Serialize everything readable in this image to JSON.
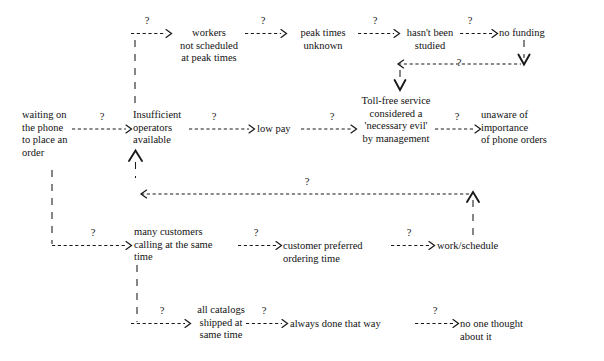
{
  "diagram": {
    "link_label": "?",
    "nodes": [
      {
        "id": "waiting",
        "text": "waiting on\nthe phone\nto place an\norder"
      },
      {
        "id": "workers",
        "text": "workers\nnot scheduled\nat peak times"
      },
      {
        "id": "peaktimes",
        "text": "peak times\nunknown"
      },
      {
        "id": "notstudied",
        "text": "hasn't been\nstudied"
      },
      {
        "id": "nofunding",
        "text": "no funding"
      },
      {
        "id": "insufficient",
        "text": "Insufficient\noperators\navailable"
      },
      {
        "id": "lowpay",
        "text": "low pay"
      },
      {
        "id": "tollfree",
        "text": "Toll-free service\nconsidered a\n'necessary evil'\nby management"
      },
      {
        "id": "unaware",
        "text": "unaware of\nimportance\nof phone orders"
      },
      {
        "id": "manycustomers",
        "text": "many customers\ncalling at the same\ntime"
      },
      {
        "id": "preferred",
        "text": "customer preferred\nordering time"
      },
      {
        "id": "workschedule",
        "text": "work/schedule"
      },
      {
        "id": "catalogs",
        "text": "all catalogs\nshipped at\nsame time"
      },
      {
        "id": "always",
        "text": "always done that way"
      },
      {
        "id": "noonethought",
        "text": "no one thought\nabout it"
      }
    ],
    "links": [
      {
        "from": "workers",
        "to": "peaktimes",
        "label": "?"
      },
      {
        "from": "peaktimes",
        "to": "notstudied",
        "label": "?"
      },
      {
        "from": "notstudied",
        "to": "nofunding",
        "label": "?"
      },
      {
        "from": "nofunding",
        "to": "tollfree",
        "label": "?"
      },
      {
        "from": "waiting",
        "to": "insufficient",
        "label": "?"
      },
      {
        "from": "insufficient",
        "to": "lowpay",
        "label": "?"
      },
      {
        "from": "lowpay",
        "to": "tollfree",
        "label": "?"
      },
      {
        "from": "tollfree",
        "to": "unaware",
        "label": "?"
      },
      {
        "from": "waiting",
        "to": "manycustomers",
        "label": "?"
      },
      {
        "from": "manycustomers",
        "to": "preferred",
        "label": "?"
      },
      {
        "from": "preferred",
        "to": "workschedule",
        "label": "?"
      },
      {
        "from": "workschedule",
        "to": "insufficient",
        "label": "?"
      },
      {
        "from": "manycustomers",
        "to": "catalogs",
        "label": "?"
      },
      {
        "from": "catalogs",
        "to": "always",
        "label": "?"
      },
      {
        "from": "always",
        "to": "noonethought",
        "label": "?"
      },
      {
        "from": "workers",
        "to": "insufficient",
        "label": ""
      }
    ],
    "colors": {
      "ink": "#121212",
      "line": "#1a1a1a",
      "background": "#ffffff"
    }
  }
}
